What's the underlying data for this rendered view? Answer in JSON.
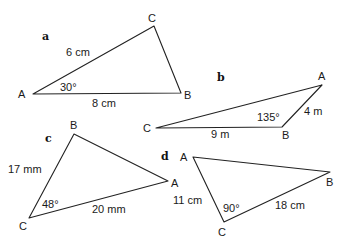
{
  "figure": {
    "triangles": [
      {
        "id": "a",
        "label": "a",
        "vertices": [
          {
            "name": "A",
            "label": "A"
          },
          {
            "name": "B",
            "label": "B"
          },
          {
            "name": "C",
            "label": "C"
          }
        ],
        "sides": [
          {
            "between": "A-C",
            "label": "6 cm"
          },
          {
            "between": "A-B",
            "label": "8 cm"
          }
        ],
        "angles": [
          {
            "at": "A",
            "label": "30°"
          }
        ]
      },
      {
        "id": "b",
        "label": "b",
        "vertices": [
          {
            "name": "A",
            "label": "A"
          },
          {
            "name": "B",
            "label": "B"
          },
          {
            "name": "C",
            "label": "C"
          }
        ],
        "sides": [
          {
            "between": "C-B",
            "label": "9 m"
          },
          {
            "between": "B-A",
            "label": "4 m"
          }
        ],
        "angles": [
          {
            "at": "B",
            "label": "135°"
          }
        ]
      },
      {
        "id": "c",
        "label": "c",
        "vertices": [
          {
            "name": "A",
            "label": "A"
          },
          {
            "name": "B",
            "label": "B"
          },
          {
            "name": "C",
            "label": "C"
          }
        ],
        "sides": [
          {
            "between": "C-B",
            "label": "17 mm"
          },
          {
            "between": "C-A",
            "label": "20 mm"
          }
        ],
        "angles": [
          {
            "at": "C",
            "label": "48°"
          }
        ]
      },
      {
        "id": "d",
        "label": "d",
        "vertices": [
          {
            "name": "A",
            "label": "A"
          },
          {
            "name": "B",
            "label": "B"
          },
          {
            "name": "C",
            "label": "C"
          }
        ],
        "sides": [
          {
            "between": "A-C",
            "label": "11 cm"
          },
          {
            "between": "C-B",
            "label": "18 cm"
          }
        ],
        "angles": [
          {
            "at": "C",
            "label": "90°"
          }
        ]
      }
    ]
  }
}
